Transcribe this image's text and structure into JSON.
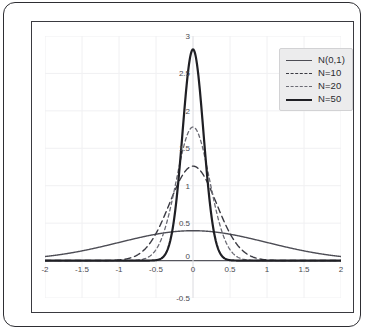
{
  "chart_data": {
    "type": "line",
    "title": "",
    "xlabel": "",
    "ylabel": "",
    "xlim": [
      -2,
      2
    ],
    "ylim": [
      -0.5,
      3
    ],
    "grid": true,
    "legend_position": "top-right",
    "xticks": [
      "-2",
      "-1.5",
      "-1",
      "-0.5",
      "0",
      "0.5",
      "1",
      "1.5",
      "2"
    ],
    "xtick_values": [
      -2,
      -1.5,
      -1,
      -0.5,
      0,
      0.5,
      1,
      1.5,
      2
    ],
    "yticks": [
      "-0.5",
      "0",
      "0.5",
      "1",
      "1.5",
      "2",
      "2.5",
      "3"
    ],
    "ytick_values": [
      -0.5,
      0,
      0.5,
      1,
      1.5,
      2,
      2.5,
      3
    ],
    "x": [
      -2,
      -1.9,
      -1.8,
      -1.7,
      -1.6,
      -1.5,
      -1.4,
      -1.3,
      -1.2,
      -1.1,
      -1,
      -0.9,
      -0.8,
      -0.7,
      -0.6,
      -0.5,
      -0.4,
      -0.3,
      -0.2,
      -0.1,
      0,
      0.1,
      0.2,
      0.3,
      0.4,
      0.5,
      0.6,
      0.7,
      0.8,
      0.9,
      1,
      1.1,
      1.2,
      1.3,
      1.4,
      1.5,
      1.6,
      1.7,
      1.8,
      1.9,
      2
    ],
    "series": [
      {
        "name": "N(0,1)",
        "style": "solid",
        "width": 1.4,
        "color": "#4d4d55",
        "sigma": 1.0,
        "peak": 0.399,
        "values": [
          0.054,
          0.066,
          0.079,
          0.094,
          0.111,
          0.13,
          0.15,
          0.171,
          0.194,
          0.218,
          0.242,
          0.266,
          0.29,
          0.312,
          0.333,
          0.352,
          0.368,
          0.381,
          0.391,
          0.397,
          0.399,
          0.397,
          0.391,
          0.381,
          0.368,
          0.352,
          0.333,
          0.312,
          0.29,
          0.266,
          0.242,
          0.218,
          0.194,
          0.171,
          0.15,
          0.13,
          0.111,
          0.094,
          0.079,
          0.066,
          0.054
        ]
      },
      {
        "name": "N=10",
        "style": "dashed",
        "width": 1.4,
        "color": "#3a3a42",
        "sigma": 0.3162,
        "peak": 1.262,
        "values": [
          0.0,
          0.0,
          0.0,
          0.0,
          0.0,
          0.0,
          0.0,
          0.001,
          0.002,
          0.007,
          0.022,
          0.06,
          0.14,
          0.29,
          0.52,
          0.83,
          1.08,
          1.22,
          1.26,
          1.26,
          1.262,
          1.26,
          1.26,
          1.22,
          1.08,
          0.83,
          0.52,
          0.29,
          0.14,
          0.06,
          0.022,
          0.007,
          0.002,
          0.001,
          0.0,
          0.0,
          0.0,
          0.0,
          0.0,
          0.0,
          0.0
        ]
      },
      {
        "name": "N=20",
        "style": "dashed-fine",
        "width": 1.3,
        "color": "#6a6a73",
        "sigma": 0.2236,
        "peak": 1.784,
        "values": [
          0.0,
          0.0,
          0.0,
          0.0,
          0.0,
          0.0,
          0.0,
          0.0,
          0.0,
          0.0,
          0.0,
          0.002,
          0.014,
          0.07,
          0.25,
          0.66,
          1.2,
          1.6,
          1.76,
          1.78,
          1.784,
          1.78,
          1.76,
          1.6,
          1.2,
          0.66,
          0.25,
          0.07,
          0.014,
          0.002,
          0.0,
          0.0,
          0.0,
          0.0,
          0.0,
          0.0,
          0.0,
          0.0,
          0.0,
          0.0,
          0.0
        ]
      },
      {
        "name": "N=50",
        "style": "solid",
        "width": 2.2,
        "color": "#1f1f24",
        "sigma": 0.1414,
        "peak": 2.821,
        "values": [
          0.0,
          0.0,
          0.0,
          0.0,
          0.0,
          0.0,
          0.0,
          0.0,
          0.0,
          0.0,
          0.0,
          0.0,
          0.0,
          0.0,
          0.02,
          0.18,
          0.8,
          1.9,
          2.63,
          2.81,
          2.821,
          2.81,
          2.63,
          1.9,
          0.8,
          0.18,
          0.02,
          0.0,
          0.0,
          0.0,
          0.0,
          0.0,
          0.0,
          0.0,
          0.0,
          0.0,
          0.0,
          0.0,
          0.0,
          0.0,
          0.0
        ]
      }
    ]
  },
  "legend": {
    "entries": [
      {
        "label": "N(0,1)"
      },
      {
        "label": "N=10"
      },
      {
        "label": "N=20"
      },
      {
        "label": "N=50"
      }
    ]
  },
  "colors": {
    "frame": "#3a3a40",
    "outer_border": "#2e2e33",
    "grid": "#f0f0f2",
    "axis": "#55555c",
    "legend_bg": "#ececed",
    "tick_text": "#4a4a50"
  }
}
